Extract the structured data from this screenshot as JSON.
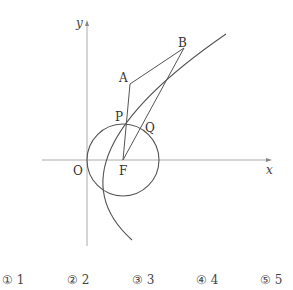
{
  "diagram": {
    "axes": {
      "x_label": "x",
      "y_label": "y"
    },
    "points": {
      "origin": "O",
      "focus": "F",
      "A": "A",
      "B": "B",
      "P": "P",
      "Q": "Q"
    },
    "elements": [
      "parabola with vertex O and focus F",
      "circle centered at F through O",
      "segment AF",
      "segment BF",
      "segment AB"
    ]
  },
  "choices": [
    {
      "mark": "①",
      "value": "1"
    },
    {
      "mark": "②",
      "value": "2"
    },
    {
      "mark": "③",
      "value": "3"
    },
    {
      "mark": "④",
      "value": "4"
    },
    {
      "mark": "⑤",
      "value": "5"
    }
  ]
}
